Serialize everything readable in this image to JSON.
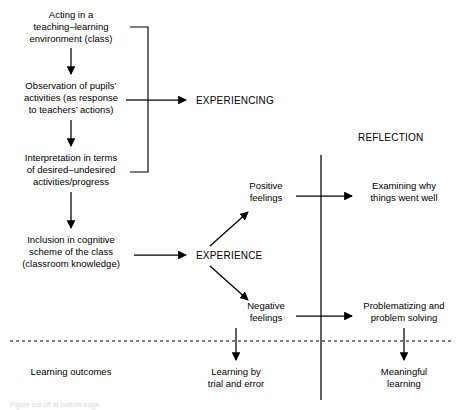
{
  "figure": {
    "caption": "Figure cut off at bottom edge"
  },
  "stages": {
    "experiencing": "EXPERIENCING",
    "reflection": "REFLECTION",
    "experience": "EXPERIENCE"
  },
  "left_column": [
    {
      "id": "acting",
      "lines": [
        "Acting in a",
        "teaching–learning",
        "environment (class)"
      ]
    },
    {
      "id": "observation",
      "lines": [
        "Observation of pupils’",
        "activities (as response",
        "to teachers’ actions)"
      ]
    },
    {
      "id": "interpretation",
      "lines": [
        "Interpretation in terms",
        "of desired–undesired",
        "activities/progress"
      ]
    },
    {
      "id": "inclusion",
      "lines": [
        "Inclusion in cognitive",
        "scheme of the class",
        "(classroom knowledge)"
      ]
    }
  ],
  "feelings": [
    {
      "id": "positive-feelings",
      "lines": [
        "Positive",
        "feelings"
      ]
    },
    {
      "id": "negative-feelings",
      "lines": [
        "Negative",
        "feelings"
      ]
    }
  ],
  "reflection_outcomes": [
    {
      "id": "examining",
      "lines": [
        "Examining why",
        "things went well"
      ]
    },
    {
      "id": "problematizing",
      "lines": [
        "Problematizing and",
        "problem solving"
      ]
    }
  ],
  "outcomes_row": {
    "label": "Learning outcomes",
    "items": [
      {
        "id": "trial-and-error",
        "lines": [
          "Learning by",
          "trial and error"
        ]
      },
      {
        "id": "meaningful-learning",
        "lines": [
          "Meaningful",
          "learning"
        ]
      }
    ]
  },
  "colors": {
    "ink": "#000000",
    "background": "#ffffff"
  }
}
